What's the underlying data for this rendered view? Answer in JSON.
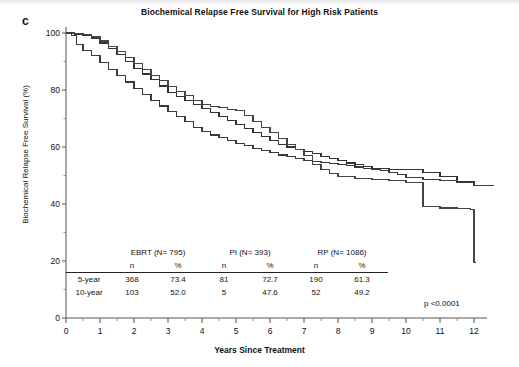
{
  "panel": {
    "label": "c"
  },
  "figure": {
    "title": "Biochemical Relapse Free Survival for High Risk Patients",
    "xlabel": "Years Since Treatment",
    "ylabel": "Biochemical Relapse Free Survival (%)",
    "pvalue": "p <0.0001"
  },
  "axes": {
    "yticks": [
      "100",
      "80",
      "60",
      "40",
      "20",
      "0"
    ],
    "xticks": [
      "0",
      "1",
      "2",
      "3",
      "4",
      "5",
      "6",
      "7",
      "8",
      "9",
      "10",
      "11",
      "12"
    ]
  },
  "table": {
    "groups": [
      "EBRT (N= 795)",
      "PI (N= 393)",
      "RP (N= 1086)"
    ],
    "subheaders": [
      "n",
      "%",
      "n",
      "%",
      "n",
      "%"
    ],
    "rows": [
      {
        "label": "5-year",
        "cells": [
          "368",
          "73.4",
          "81",
          "72.7",
          "190",
          "61.3"
        ]
      },
      {
        "label": "10-year",
        "cells": [
          "103",
          "52.0",
          "5",
          "47.6",
          "52",
          "49.2"
        ]
      }
    ]
  },
  "chart_data": {
    "type": "line",
    "title": "Biochemical Relapse Free Survival for High Risk Patients",
    "xlabel": "Years Since Treatment",
    "ylabel": "Biochemical Relapse Free Survival (%)",
    "xlim": [
      0,
      12.6
    ],
    "ylim": [
      0,
      100
    ],
    "grid": false,
    "legend": "none",
    "annotations": [
      "p <0.0001"
    ],
    "series": [
      {
        "name": "EBRT (N= 795)",
        "color": "#333333",
        "five_year_n": 368,
        "five_year_pct": 73.4,
        "ten_year_n": 103,
        "ten_year_pct": 52.0,
        "x": [
          0,
          0.25,
          0.5,
          0.75,
          1,
          1.25,
          1.5,
          1.75,
          2,
          2.25,
          2.5,
          2.75,
          3,
          3.25,
          3.5,
          3.75,
          4,
          4.25,
          4.5,
          4.75,
          5,
          5.25,
          5.5,
          5.75,
          6,
          6.25,
          6.5,
          6.75,
          7,
          7.25,
          7.5,
          7.75,
          8,
          8.25,
          8.5,
          8.75,
          9,
          9.25,
          9.5,
          9.75,
          10,
          10.5,
          11,
          11.5,
          12,
          12.4
        ],
        "y": [
          100,
          99.6,
          99.2,
          98.2,
          96.5,
          94.5,
          92.3,
          90.0,
          87.6,
          85.6,
          83.6,
          81.4,
          79.2,
          77.6,
          76.3,
          74.8,
          73.4,
          72.0,
          70.6,
          69.2,
          67.8,
          66.4,
          65.0,
          63.6,
          62.2,
          61.0,
          60.0,
          59.2,
          58.4,
          57.6,
          56.8,
          56.0,
          55.2,
          54.4,
          53.8,
          53.2,
          52.6,
          52.4,
          52.2,
          52.1,
          52.0,
          51.0,
          49.5,
          48.0,
          46.5,
          46.4
        ]
      },
      {
        "name": "PI (N= 393)",
        "color": "#444444",
        "five_year_n": 81,
        "five_year_pct": 72.7,
        "ten_year_n": 5,
        "ten_year_pct": 47.6,
        "x": [
          0,
          0.25,
          0.5,
          0.75,
          1,
          1.25,
          1.5,
          1.75,
          2,
          2.25,
          2.5,
          2.75,
          3,
          3.25,
          3.5,
          3.75,
          4,
          4.25,
          4.5,
          4.75,
          5,
          5.25,
          5.5,
          5.75,
          6,
          6.25,
          6.5,
          6.75,
          7,
          7.25,
          7.5,
          7.75,
          8,
          8.5,
          9,
          9.5,
          10,
          10.5,
          11,
          11.5,
          11.9,
          12.0,
          12.05
        ],
        "y": [
          100,
          99.8,
          99.4,
          98.6,
          97.2,
          95.4,
          93.6,
          91.5,
          89.3,
          87.2,
          85.2,
          83.2,
          81.2,
          79.6,
          78.0,
          76.4,
          74.8,
          74.2,
          73.8,
          73.2,
          72.7,
          71.0,
          69.0,
          67.0,
          65.0,
          63.0,
          61.0,
          59.0,
          57.0,
          54.0,
          52.2,
          50.8,
          49.5,
          49.0,
          48.6,
          48.2,
          47.6,
          39.0,
          38.6,
          38.4,
          38.2,
          19.5,
          19.5
        ]
      },
      {
        "name": "RP (N= 1086)",
        "color": "#3a3a3a",
        "five_year_n": 190,
        "five_year_pct": 61.3,
        "ten_year_n": 52,
        "ten_year_pct": 49.2,
        "x": [
          0,
          0.15,
          0.3,
          0.5,
          0.75,
          1,
          1.25,
          1.5,
          1.75,
          2,
          2.25,
          2.5,
          2.75,
          3,
          3.25,
          3.5,
          3.75,
          4,
          4.25,
          4.5,
          4.75,
          5,
          5.25,
          5.5,
          5.75,
          6,
          6.25,
          6.5,
          6.75,
          7,
          7.25,
          7.5,
          7.75,
          8,
          8.25,
          8.5,
          8.75,
          9,
          9.25,
          9.5,
          9.75,
          10,
          10.5,
          11,
          11.5,
          12,
          12.6
        ],
        "y": [
          100,
          99.0,
          96.0,
          94.0,
          92.0,
          89.5,
          87.2,
          85.0,
          82.8,
          80.6,
          78.4,
          76.4,
          74.4,
          72.4,
          70.6,
          68.8,
          67.0,
          65.4,
          64.2,
          63.2,
          62.2,
          61.3,
          60.4,
          59.6,
          58.8,
          58.0,
          57.2,
          56.6,
          56.0,
          55.4,
          55.0,
          54.6,
          54.2,
          53.8,
          53.4,
          53.0,
          52.6,
          52.2,
          51.6,
          51.0,
          50.4,
          49.2,
          48.6,
          48.2,
          47.4,
          46.6,
          46.5
        ]
      }
    ]
  }
}
